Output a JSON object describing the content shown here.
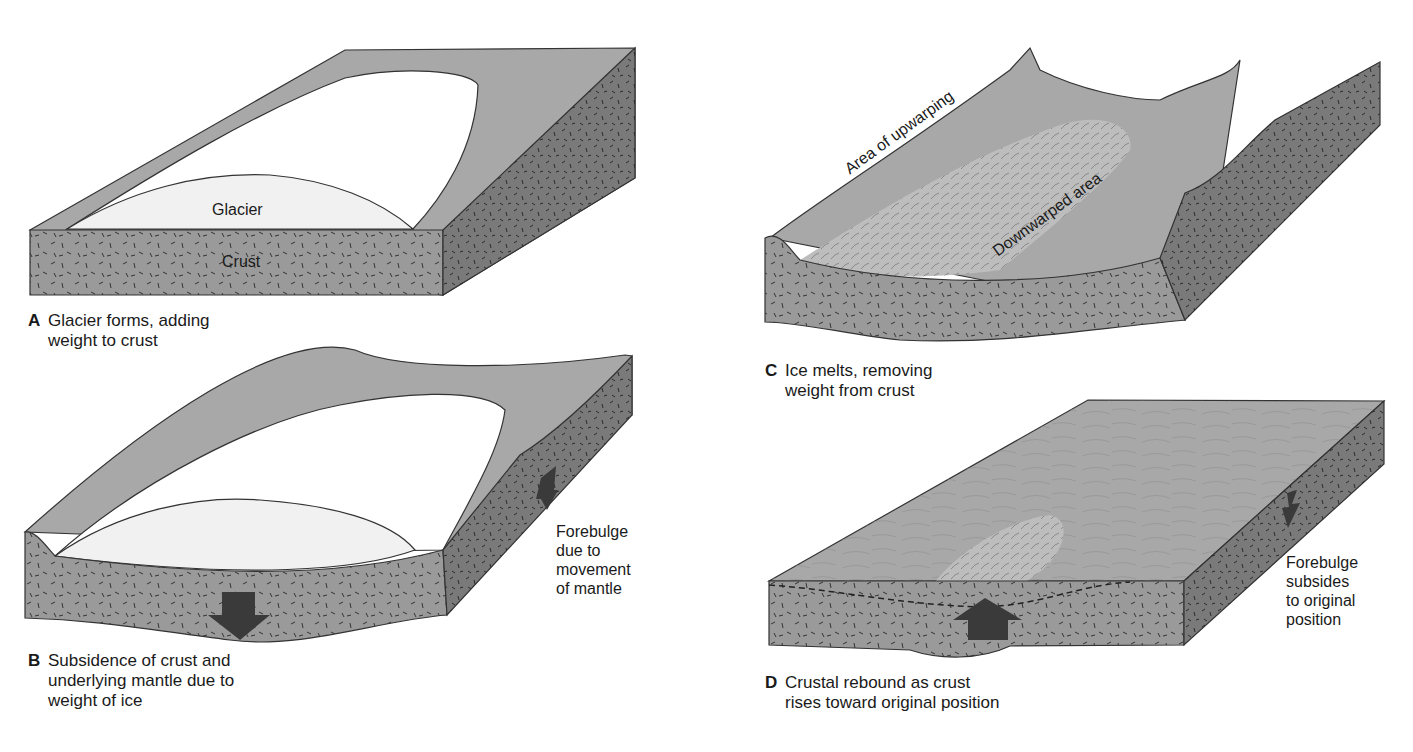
{
  "figure": {
    "panels": [
      {
        "id": "A",
        "letter": "A",
        "caption_line1": "Glacier forms, adding",
        "caption_line2": "weight to crust",
        "labels": {
          "glacier": "Glacier",
          "crust": "Crust"
        }
      },
      {
        "id": "B",
        "letter": "B",
        "caption_line1": "Subsidence of crust and",
        "caption_line2": "underlying mantle due to",
        "caption_line3": "weight of ice",
        "labels": {
          "forebulge": [
            "Forebulge",
            "due to",
            "movement",
            "of mantle"
          ]
        }
      },
      {
        "id": "C",
        "letter": "C",
        "caption_line1": "Ice melts, removing",
        "caption_line2": "weight from crust",
        "labels": {
          "upwarping": "Area of upwarping",
          "downwarped": "Downwarped area"
        }
      },
      {
        "id": "D",
        "letter": "D",
        "caption_line1": "Crustal rebound as crust",
        "caption_line2": "rises toward original position",
        "labels": {
          "forebulge": [
            "Forebulge",
            "subsides",
            "to original",
            "position"
          ]
        }
      }
    ],
    "colors": {
      "surface": "#a8a8a8",
      "crust_front": "#9a9a9a",
      "crust_side": "#7a7a7a",
      "ice": "#ffffff",
      "ice_front": "#f1f1f1",
      "depression": "#bdbdbd",
      "arrow": "#3a3a3a",
      "outline": "#333333"
    }
  }
}
